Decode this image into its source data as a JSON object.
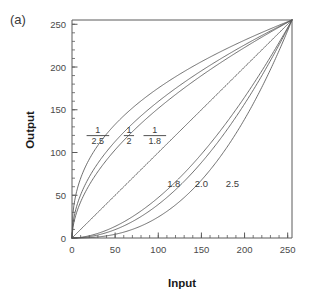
{
  "figure": {
    "panel_label": "(a)",
    "background_color": "#ffffff",
    "curve_color": "#555555",
    "axis_color": "#5a5a5a",
    "text_color": "#3c3c3c"
  },
  "chart_data": {
    "type": "line",
    "title": "",
    "subtitle": "",
    "xlabel": "Input",
    "ylabel": "Output",
    "xlim": [
      0,
      255
    ],
    "ylim": [
      0,
      255
    ],
    "xticks": [
      0,
      50,
      100,
      150,
      200,
      250
    ],
    "yticks": [
      0,
      50,
      100,
      150,
      200,
      250
    ],
    "xtick_labels": [
      "0",
      "50",
      "100",
      "150",
      "200",
      "250"
    ],
    "ytick_labels": [
      "0",
      "50",
      "100",
      "150",
      "200",
      "250"
    ],
    "minor_tick_interval": 10,
    "grid": false,
    "legend_position": "inline-annotations",
    "formula": "y = 255 * (x / 255) ^ gamma",
    "series": [
      {
        "name": "1/2.5",
        "gamma": 0.4,
        "label_display": "1/2.5",
        "label_numerator": "1",
        "label_denominator": "2.5",
        "label_x": 30,
        "label_y": 118,
        "values": [
          {
            "x": 0,
            "y": 0
          },
          {
            "x": 25,
            "y": 98
          },
          {
            "x": 50,
            "y": 129
          },
          {
            "x": 75,
            "y": 152
          },
          {
            "x": 100,
            "y": 170
          },
          {
            "x": 125,
            "y": 186
          },
          {
            "x": 150,
            "y": 200
          },
          {
            "x": 175,
            "y": 213
          },
          {
            "x": 200,
            "y": 225
          },
          {
            "x": 225,
            "y": 236
          },
          {
            "x": 250,
            "y": 247
          },
          {
            "x": 255,
            "y": 249
          }
        ]
      },
      {
        "name": "1/2",
        "gamma": 0.5,
        "label_display": "1/2",
        "label_numerator": "1",
        "label_denominator": "2",
        "label_x": 66,
        "label_y": 118,
        "values": [
          {
            "x": 0,
            "y": 0
          },
          {
            "x": 25,
            "y": 79
          },
          {
            "x": 50,
            "y": 113
          },
          {
            "x": 75,
            "y": 138
          },
          {
            "x": 100,
            "y": 160
          },
          {
            "x": 125,
            "y": 179
          },
          {
            "x": 150,
            "y": 195
          },
          {
            "x": 175,
            "y": 211
          },
          {
            "x": 200,
            "y": 226
          },
          {
            "x": 225,
            "y": 239
          },
          {
            "x": 250,
            "y": 249
          },
          {
            "x": 255,
            "y": 252
          }
        ]
      },
      {
        "name": "1/1.8",
        "gamma": 0.5556,
        "label_display": "1/1.8",
        "label_numerator": "1",
        "label_denominator": "1.8",
        "label_x": 96,
        "label_y": 118,
        "values": [
          {
            "x": 0,
            "y": 0
          },
          {
            "x": 25,
            "y": 72
          },
          {
            "x": 50,
            "y": 106
          },
          {
            "x": 75,
            "y": 132
          },
          {
            "x": 100,
            "y": 155
          },
          {
            "x": 125,
            "y": 175
          },
          {
            "x": 150,
            "y": 193
          },
          {
            "x": 175,
            "y": 209
          },
          {
            "x": 200,
            "y": 225
          },
          {
            "x": 225,
            "y": 239
          },
          {
            "x": 250,
            "y": 251
          },
          {
            "x": 255,
            "y": 253
          }
        ]
      },
      {
        "name": "1.0",
        "gamma": 1.0,
        "label_display": "",
        "label_x": null,
        "label_y": null,
        "values": [
          {
            "x": 0,
            "y": 0
          },
          {
            "x": 50,
            "y": 50
          },
          {
            "x": 100,
            "y": 100
          },
          {
            "x": 150,
            "y": 150
          },
          {
            "x": 200,
            "y": 200
          },
          {
            "x": 250,
            "y": 250
          },
          {
            "x": 255,
            "y": 255
          }
        ]
      },
      {
        "name": "1.8",
        "gamma": 1.8,
        "label_display": "1.8",
        "label_x": 118,
        "label_y": 63,
        "values": [
          {
            "x": 0,
            "y": 0
          },
          {
            "x": 25,
            "y": 4
          },
          {
            "x": 50,
            "y": 14
          },
          {
            "x": 75,
            "y": 29
          },
          {
            "x": 100,
            "y": 48
          },
          {
            "x": 125,
            "y": 72
          },
          {
            "x": 150,
            "y": 99
          },
          {
            "x": 175,
            "y": 130
          },
          {
            "x": 200,
            "y": 165
          },
          {
            "x": 225,
            "y": 203
          },
          {
            "x": 250,
            "y": 245
          },
          {
            "x": 255,
            "y": 255
          }
        ]
      },
      {
        "name": "2.0",
        "gamma": 2.0,
        "label_display": "2.0",
        "label_x": 150,
        "label_y": 63,
        "values": [
          {
            "x": 0,
            "y": 0
          },
          {
            "x": 25,
            "y": 2
          },
          {
            "x": 50,
            "y": 10
          },
          {
            "x": 75,
            "y": 22
          },
          {
            "x": 100,
            "y": 39
          },
          {
            "x": 125,
            "y": 61
          },
          {
            "x": 150,
            "y": 88
          },
          {
            "x": 175,
            "y": 120
          },
          {
            "x": 200,
            "y": 157
          },
          {
            "x": 225,
            "y": 199
          },
          {
            "x": 250,
            "y": 245
          },
          {
            "x": 255,
            "y": 255
          }
        ]
      },
      {
        "name": "2.5",
        "gamma": 2.5,
        "label_display": "2.5",
        "label_x": 186,
        "label_y": 63,
        "values": [
          {
            "x": 0,
            "y": 0
          },
          {
            "x": 25,
            "y": 1
          },
          {
            "x": 50,
            "y": 4
          },
          {
            "x": 75,
            "y": 11
          },
          {
            "x": 100,
            "y": 24
          },
          {
            "x": 125,
            "y": 42
          },
          {
            "x": 150,
            "y": 67
          },
          {
            "x": 175,
            "y": 100
          },
          {
            "x": 200,
            "y": 140
          },
          {
            "x": 225,
            "y": 189
          },
          {
            "x": 250,
            "y": 245
          },
          {
            "x": 255,
            "y": 255
          }
        ]
      }
    ]
  }
}
